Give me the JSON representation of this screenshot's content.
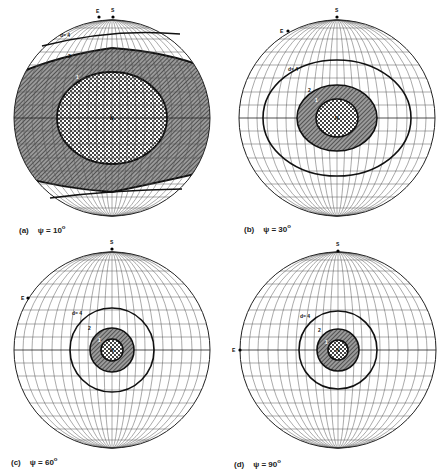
{
  "figure": {
    "panels": [
      {
        "id": "a",
        "label": "(a)",
        "psi_symbol": "ψ",
        "psi_value": "= 10",
        "psi_unit": "o",
        "cx": 112,
        "cy": 118,
        "r": 98,
        "pole_E": {
          "label": "E",
          "x": 99,
          "y": 17
        },
        "pole_S": {
          "label": "S",
          "x": 113,
          "y": 17
        },
        "contour_labels": {
          "d4": "d= 4",
          "d2": "2",
          "d1": "1",
          "center": "N"
        }
      },
      {
        "id": "b",
        "label": "(b)",
        "psi_symbol": "ψ",
        "psi_value": "= 30",
        "psi_unit": "o",
        "cx": 337,
        "cy": 118,
        "r": 98,
        "pole_E": {
          "label": "E",
          "x": 288,
          "y": 31
        },
        "pole_S": {
          "label": "S",
          "x": 337,
          "y": 17
        },
        "contour_labels": {
          "d4": "d= 4",
          "d2": "2",
          "d1": "1",
          "center": "N"
        }
      },
      {
        "id": "c",
        "label": "(c)",
        "psi_symbol": "ψ",
        "psi_value": "= 60",
        "psi_unit": "o",
        "cx": 112,
        "cy": 350,
        "r": 98,
        "pole_E": {
          "label": "E",
          "x": 28,
          "y": 298
        },
        "pole_S": {
          "label": "S",
          "x": 112,
          "y": 249
        },
        "contour_labels": {
          "d4": "d= 4",
          "d2": "2",
          "d1": "1",
          "center": "N"
        }
      },
      {
        "id": "d",
        "label": "(d)",
        "psi_symbol": "ψ",
        "psi_value": "= 90",
        "psi_unit": "o",
        "cx": 338,
        "cy": 350,
        "r": 98,
        "pole_E": {
          "label": "E",
          "x": 240,
          "y": 350
        },
        "pole_S": {
          "label": "S",
          "x": 338,
          "y": 251
        },
        "contour_labels": {
          "d4": "d= 4",
          "d2": "2",
          "d1": "1",
          "center": "N"
        }
      }
    ],
    "captions": {
      "a": {
        "label": "(a)",
        "psi": "ψ = 10",
        "deg": "o"
      },
      "b": {
        "label": "(b)",
        "psi": "ψ = 30",
        "deg": "o"
      },
      "c": {
        "label": "(c)",
        "psi": "ψ = 60",
        "deg": "o"
      },
      "d": {
        "label": "(d)",
        "psi": "ψ = 90",
        "deg": "o"
      }
    },
    "legend_meaning": {
      "crosshatch": "d < 1",
      "diagonal_hatch": "1 < d < 2",
      "contours": [
        "1",
        "2",
        "4"
      ]
    }
  }
}
